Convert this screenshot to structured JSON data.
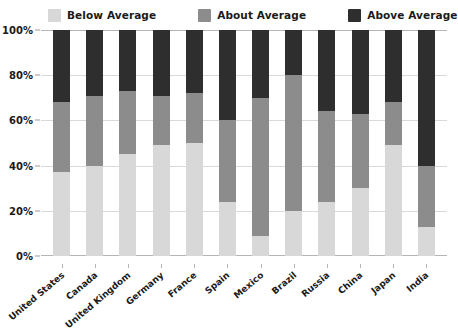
{
  "chart_data": {
    "type": "bar",
    "subtype": "stacked-bar-100-percent",
    "title": "",
    "xlabel": "",
    "ylabel": "",
    "ylim": [
      0,
      100
    ],
    "yticks": [
      "0%",
      "20%",
      "40%",
      "60%",
      "80%",
      "100%"
    ],
    "ytick_values": [
      0,
      20,
      40,
      60,
      80,
      100
    ],
    "grid": true,
    "legend_position": "top",
    "categories": [
      "United States",
      "Canada",
      "United Kingdom",
      "Germany",
      "France",
      "Spain",
      "Mexico",
      "Brazil",
      "Russia",
      "China",
      "Japan",
      "India"
    ],
    "series": [
      {
        "name": "Below Average",
        "color": "#d8d8d8",
        "values": [
          37,
          40,
          45,
          49,
          50,
          24,
          9,
          20,
          24,
          30,
          49,
          13
        ]
      },
      {
        "name": "About Average",
        "color": "#8c8c8c",
        "values": [
          31,
          31,
          28,
          22,
          22,
          36,
          61,
          60,
          40,
          33,
          19,
          27
        ]
      },
      {
        "name": "Above Average",
        "color": "#2e2e2e",
        "values": [
          32,
          29,
          27,
          29,
          28,
          40,
          30,
          20,
          36,
          37,
          32,
          60
        ]
      }
    ]
  },
  "legend": {
    "items": [
      {
        "label": "Below Average",
        "color": "#d8d8d8"
      },
      {
        "label": "About Average",
        "color": "#8c8c8c"
      },
      {
        "label": "Above Average",
        "color": "#2e2e2e"
      }
    ]
  }
}
